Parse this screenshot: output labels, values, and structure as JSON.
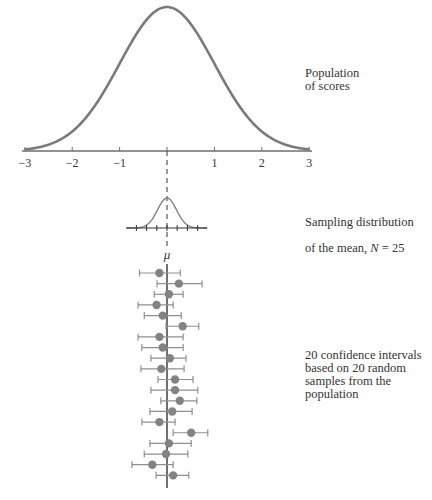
{
  "chart_data": {
    "type": "diagram",
    "title": "",
    "population": {
      "label": "Population\nof scores",
      "distribution": "normal",
      "mean": 0,
      "sd": 1,
      "x_ticks": [
        -3,
        -2,
        -1,
        0,
        1,
        2,
        3
      ],
      "x_tick_labels": [
        "−3",
        "−2",
        "−1",
        "",
        "1",
        "2",
        "3"
      ],
      "xlim": [
        -3,
        3
      ]
    },
    "sampling_distribution": {
      "label_line1": "Sampling distribution",
      "label_line2_prefix": "of the mean, ",
      "label_N_symbol": "N",
      "label_N_eq": " = 25",
      "N": 25,
      "sd": 0.2,
      "tick_count": 7,
      "center_label": "μ"
    },
    "confidence_intervals": {
      "label": "20 confidence intervals\nbased on 20 random\nsamples from the\npopulation",
      "count": 20,
      "true_mean": 0,
      "intervals": [
        {
          "low": -0.58,
          "mean": -0.16,
          "high": 0.28
        },
        {
          "low": -0.21,
          "mean": 0.25,
          "high": 0.74
        },
        {
          "low": -0.27,
          "mean": 0.04,
          "high": 0.34
        },
        {
          "low": -0.61,
          "mean": -0.22,
          "high": 0.13
        },
        {
          "low": -0.48,
          "mean": -0.09,
          "high": 0.3
        },
        {
          "low": -0.02,
          "mean": 0.33,
          "high": 0.67
        },
        {
          "low": -0.61,
          "mean": -0.16,
          "high": 0.34
        },
        {
          "low": -0.53,
          "mean": -0.09,
          "high": 0.34
        },
        {
          "low": -0.34,
          "mean": 0.06,
          "high": 0.4
        },
        {
          "low": -0.55,
          "mean": -0.12,
          "high": 0.36
        },
        {
          "low": -0.19,
          "mean": 0.17,
          "high": 0.55
        },
        {
          "low": -0.34,
          "mean": 0.17,
          "high": 0.65
        },
        {
          "low": -0.13,
          "mean": 0.27,
          "high": 0.63
        },
        {
          "low": -0.36,
          "mean": 0.11,
          "high": 0.53
        },
        {
          "low": -0.53,
          "mean": -0.16,
          "high": 0.17
        },
        {
          "low": 0.13,
          "mean": 0.51,
          "high": 0.86
        },
        {
          "low": -0.36,
          "mean": 0.04,
          "high": 0.51
        },
        {
          "low": -0.48,
          "mean": -0.02,
          "high": 0.44
        },
        {
          "low": -0.74,
          "mean": -0.31,
          "high": 0.13
        },
        {
          "low": -0.23,
          "mean": 0.13,
          "high": 0.46
        }
      ]
    },
    "colors": {
      "curve": "#7a7a7a",
      "axis": "#6e6e6e",
      "dot": "#838383",
      "interval": "#8f8f8f",
      "mean_line": "#222222"
    }
  }
}
